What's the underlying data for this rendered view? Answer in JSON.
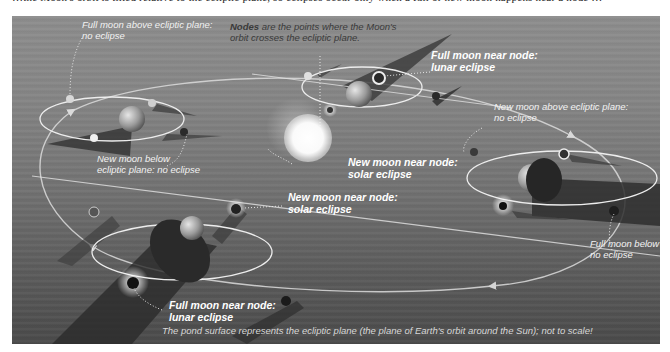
{
  "figure": {
    "clipped_caption_line": "…the Moon's orbit is tilted relative to the ecliptic plane, so eclipses occur only when a full or new moon happens near a node …",
    "labels": {
      "nodes_definition": {
        "bold": "Nodes",
        "rest_line1": " are the points where the Moon's",
        "line2": "orbit crosses the ecliptic plane."
      },
      "full_above": {
        "line1": "Full moon above ecliptic plane:",
        "line2": "no eclipse"
      },
      "full_near_node_top": {
        "line1": "Full moon near node:",
        "line2": "lunar eclipse"
      },
      "new_above": {
        "line1": "New moon above ecliptic plane:",
        "line2": "no eclipse"
      },
      "new_near_node_center": {
        "line1": "New moon near node:",
        "line2": "solar eclipse"
      },
      "new_below": {
        "line1": "New moon below",
        "line2": "ecliptic plane: no eclipse"
      },
      "new_near_node_lower": {
        "line1": "New moon near node:",
        "line2": "solar eclipse"
      },
      "full_below": {
        "line1": "Full moon below ecliptic plane:",
        "line2": "no eclipse"
      },
      "full_near_node_bottom": {
        "line1": "Full moon near node:",
        "line2": "lunar eclipse"
      }
    },
    "footer_note": "The pond surface represents the ecliptic plane (the plane of Earth's orbit around the Sun); not to scale!",
    "colors": {
      "background_top": "#8d8d8d",
      "background_bottom": "#4a4a4a",
      "orbit_line": "#e8e8e8",
      "sun": "#ffffff",
      "shadow": "#2e2e2e"
    },
    "icons": [
      "sun-icon",
      "earth-icon",
      "moon-icon",
      "shadow-cone-icon",
      "orbit-arrow-icon"
    ]
  }
}
